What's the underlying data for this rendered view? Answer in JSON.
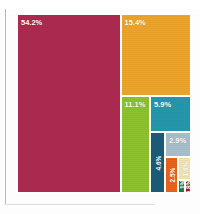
{
  "header": {
    "title": "SPENDING BY PRIMARY/KEY CATEGORY",
    "title_clipped": true
  },
  "chart_data": {
    "type": "treemap",
    "title": "SPENDING BY PRIMARY/KEY CATEGORY",
    "xlabel": "",
    "ylabel": "",
    "grid": false,
    "legend": "none",
    "unit": "percent",
    "categories": [
      "54.2%",
      "15.4%",
      "11.1%",
      "5.9%",
      "4.6%",
      "2.9%",
      "2.5%",
      "1.6%",
      "1.1%",
      "0.8%"
    ],
    "values": [
      54.2,
      15.4,
      11.1,
      5.9,
      4.6,
      2.9,
      2.5,
      1.6,
      1.1,
      0.8
    ],
    "colors": [
      "#ac2a4f",
      "#eda42a",
      "#8cc22b",
      "#2597ac",
      "#1a5c77",
      "#a8bfcb",
      "#e8621a",
      "#f2e3b0",
      "#1e7a46",
      "#9e1b28"
    ],
    "segments": [
      {
        "label": "54.2%",
        "value": 54.2,
        "color": "#ac2a4f",
        "label_orient": "horizontal",
        "x": 0,
        "y": 0,
        "w": 103.5,
        "h": 179
      },
      {
        "label": "15.4%",
        "value": 15.4,
        "color": "#eda42a",
        "label_orient": "horizontal",
        "x": 103.5,
        "y": 0,
        "w": 70.5,
        "h": 82
      },
      {
        "label": "11.1%",
        "value": 11.1,
        "color": "#8cc22b",
        "label_orient": "horizontal",
        "x": 103.5,
        "y": 82,
        "w": 29.5,
        "h": 97
      },
      {
        "label": "5.9%",
        "value": 5.9,
        "color": "#2597ac",
        "label_orient": "horizontal",
        "x": 133,
        "y": 82,
        "w": 41,
        "h": 36
      },
      {
        "label": "4.6%",
        "value": 4.6,
        "color": "#1a5c77",
        "label_orient": "vertical",
        "x": 133,
        "y": 118,
        "w": 15,
        "h": 61
      },
      {
        "label": "2.9%",
        "value": 2.9,
        "color": "#a8bfcb",
        "label_orient": "horizontal",
        "x": 148,
        "y": 118,
        "w": 26,
        "h": 25
      },
      {
        "label": "2.5%",
        "value": 2.5,
        "color": "#e8621a",
        "label_orient": "vertical",
        "x": 148,
        "y": 143,
        "w": 13,
        "h": 36
      },
      {
        "label": "1.6%",
        "value": 1.6,
        "color": "#f2e3b0",
        "label_orient": "vertical",
        "x": 161,
        "y": 143,
        "w": 13,
        "h": 23
      },
      {
        "label": "1.1%",
        "value": 1.1,
        "color": "#1e7a46",
        "label_orient": "vertical",
        "x": 161,
        "y": 166,
        "w": 7,
        "h": 13
      },
      {
        "label": "0.8%",
        "value": 0.8,
        "color": "#9e1b28",
        "label_orient": "vertical",
        "x": 168,
        "y": 166,
        "w": 6,
        "h": 13
      }
    ]
  }
}
